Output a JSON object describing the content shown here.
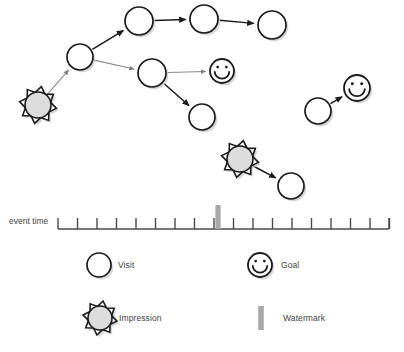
{
  "axis": {
    "label": "event time",
    "x_start": 58,
    "x_end": 389,
    "y": 229,
    "tick_count": 18,
    "tick_spacing": 19.5,
    "tick_height": 11,
    "watermark_x": 218,
    "watermark_color": "#a8a8a8",
    "line_color": "#4a4a4a"
  },
  "legend": {
    "items": [
      {
        "icon": "circle-icon",
        "label": "Visit",
        "icon_x": 99,
        "icon_y": 265,
        "radius": 12
      },
      {
        "icon": "smiley-icon",
        "label": "Goal",
        "icon_x": 260,
        "icon_y": 265,
        "radius": 12
      },
      {
        "icon": "sun-icon",
        "label": "Impression",
        "icon_x": 100,
        "icon_y": 318,
        "radius": 12
      },
      {
        "icon": "watermark-bar-icon",
        "label": "Watermark",
        "icon_x": 261,
        "icon_y": 318,
        "radius": 0
      }
    ]
  },
  "colors": {
    "node_fill": "#ffffff",
    "node_stroke": "#1a1a1a",
    "impression_fill": "#dcdcdc",
    "impression_stroke": "#1a1a1a",
    "goal_fill": "#ffffff",
    "goal_stroke": "#1a1a1a",
    "edge_dark": "#1a1a1a",
    "edge_light": "#8a8a8a",
    "watermark": "#a8a8a8",
    "shadow": "#c9c9c9",
    "text": "#3f3f3f"
  },
  "chart_data": {
    "type": "diagram",
    "title": "",
    "nodes": [
      {
        "id": "imp1",
        "type": "Impression",
        "x": 38,
        "y": 105,
        "r": 13
      },
      {
        "id": "v1",
        "type": "Visit",
        "x": 80,
        "y": 57,
        "r": 13
      },
      {
        "id": "v2",
        "type": "Visit",
        "x": 139,
        "y": 21,
        "r": 14
      },
      {
        "id": "v3",
        "type": "Visit",
        "x": 204,
        "y": 19,
        "r": 14
      },
      {
        "id": "v4",
        "type": "Visit",
        "x": 272,
        "y": 25,
        "r": 14
      },
      {
        "id": "v5",
        "type": "Visit",
        "x": 152,
        "y": 73,
        "r": 14
      },
      {
        "id": "g1",
        "type": "Goal",
        "x": 222,
        "y": 71,
        "r": 12
      },
      {
        "id": "v6",
        "type": "Visit",
        "x": 202,
        "y": 117,
        "r": 13
      },
      {
        "id": "v7",
        "type": "Visit",
        "x": 318,
        "y": 111,
        "r": 13
      },
      {
        "id": "g2",
        "type": "Goal",
        "x": 357,
        "y": 88,
        "r": 13
      },
      {
        "id": "imp2",
        "type": "Impression",
        "x": 240,
        "y": 159,
        "r": 13
      },
      {
        "id": "v8",
        "type": "Visit",
        "x": 291,
        "y": 186,
        "r": 13
      }
    ],
    "edges": [
      {
        "from": "imp1",
        "to": "v1",
        "style": "light"
      },
      {
        "from": "v1",
        "to": "v2",
        "style": "dark"
      },
      {
        "from": "v2",
        "to": "v3",
        "style": "dark"
      },
      {
        "from": "v3",
        "to": "v4",
        "style": "dark"
      },
      {
        "from": "v1",
        "to": "v5",
        "style": "light"
      },
      {
        "from": "v5",
        "to": "g1",
        "style": "light"
      },
      {
        "from": "v5",
        "to": "v6",
        "style": "dark"
      },
      {
        "from": "v7",
        "to": "g2",
        "style": "dark"
      },
      {
        "from": "imp2",
        "to": "v8",
        "style": "dark"
      }
    ]
  }
}
